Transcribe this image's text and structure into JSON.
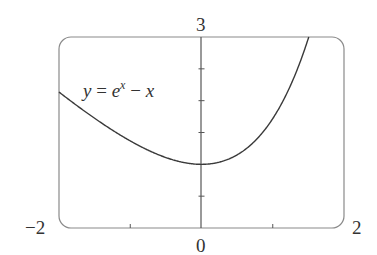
{
  "chart_data": {
    "type": "line",
    "title": "",
    "xlabel": "",
    "ylabel": "",
    "function": "y = e^x - x",
    "xlim": [
      -2,
      2
    ],
    "ylim": [
      0,
      3
    ],
    "grid": false,
    "x_ticks": [
      -1,
      0,
      1
    ],
    "y_ticks": [
      0.5,
      1,
      1.5,
      2,
      2.5
    ],
    "tick_labels": {
      "x_min": "−2",
      "x_max": "2",
      "x_zero": "0",
      "y_max": "3"
    },
    "annotation": {
      "y": "y",
      "eq": "=",
      "base": "e",
      "exp": "x",
      "minus": "−",
      "x": "x"
    },
    "series": [
      {
        "name": "y = e^x - x",
        "x": [
          -2.0,
          -1.75,
          -1.5,
          -1.25,
          -1.0,
          -0.75,
          -0.5,
          -0.25,
          0.0,
          0.25,
          0.5,
          0.75,
          1.0,
          1.25,
          1.5
        ],
        "y": [
          2.135,
          1.924,
          1.723,
          1.537,
          1.368,
          1.222,
          1.107,
          1.029,
          1.0,
          1.034,
          1.149,
          1.367,
          1.718,
          2.24,
          2.982
        ]
      }
    ],
    "colors": {
      "curve": "#3a3a3a",
      "frame": "#8a8a8a",
      "axis": "#555555"
    }
  }
}
